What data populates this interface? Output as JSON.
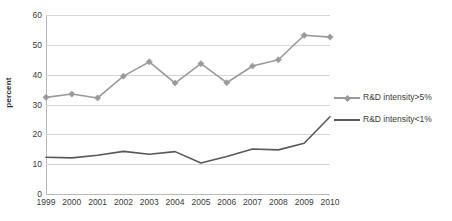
{
  "chart_data": {
    "type": "line",
    "title": "",
    "xlabel": "",
    "ylabel": "percent",
    "categories": [
      "1999",
      "2000",
      "2001",
      "2002",
      "2003",
      "2004",
      "2005",
      "2006",
      "2007",
      "2008",
      "2009",
      "2010"
    ],
    "ylim": [
      0,
      60
    ],
    "yticks": [
      0,
      10,
      20,
      30,
      40,
      50,
      60
    ],
    "ytick_labels": [
      "0",
      "10",
      "20",
      "30",
      "40",
      "50",
      "60"
    ],
    "grid": true,
    "legend_position": "right",
    "series": [
      {
        "name": "R&D intensity>5%",
        "color": "#9a9a9a",
        "marker": "diamond",
        "values": [
          32.4,
          33.5,
          32.2,
          39.5,
          44.3,
          37.2,
          43.7,
          37.3,
          42.9,
          45.0,
          53.2,
          52.6
        ]
      },
      {
        "name": "R&D intensity<1%",
        "color": "#595959",
        "marker": "none",
        "values": [
          12.3,
          12.1,
          13.0,
          14.3,
          13.3,
          14.2,
          10.4,
          12.6,
          15.1,
          14.8,
          17.0,
          25.9
        ]
      }
    ]
  },
  "legend": {
    "items": [
      {
        "label": "R&D intensity>5%"
      },
      {
        "label": "R&D intensity<1%"
      }
    ]
  },
  "axes": {
    "y_title": "percent"
  }
}
